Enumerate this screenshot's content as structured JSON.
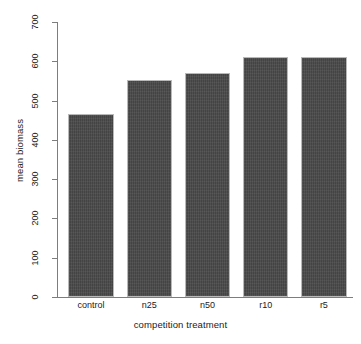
{
  "chart_data": {
    "type": "bar",
    "title": "",
    "xlabel": "competition treatment",
    "ylabel": "mean biomass",
    "categories": [
      "control",
      "n25",
      "n50",
      "r10",
      "r5"
    ],
    "values": [
      465,
      553,
      570,
      610,
      610
    ],
    "ylim": [
      0,
      700
    ],
    "yticks": [
      0,
      100,
      200,
      300,
      400,
      500,
      600,
      700
    ],
    "ytick_labels": [
      "0",
      "100",
      "200",
      "300",
      "400",
      "500",
      "600",
      "700"
    ],
    "grid": false,
    "legend": null,
    "bar_color": "#4a4a4a",
    "background_color": "#ffffff",
    "axis_color": "#7d7d7d"
  }
}
